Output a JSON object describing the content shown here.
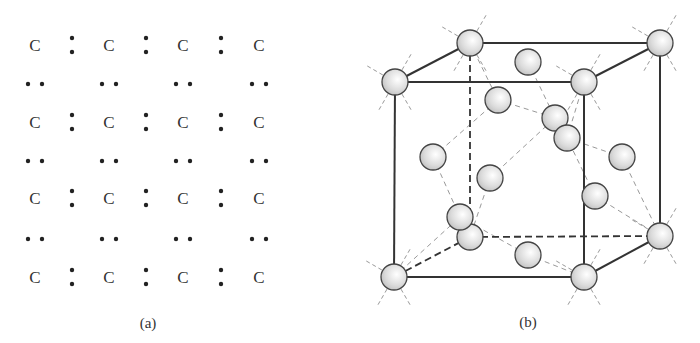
{
  "figure": {
    "panel_a": {
      "label": "(a)",
      "atom_symbol": "C",
      "description": "Lewis dot structure of carbon lattice: 4x4 grid of C atoms with shared electron pairs",
      "columns_x": [
        35,
        109,
        183,
        259
      ],
      "rows_y": [
        45,
        122,
        198,
        277
      ],
      "vertical_pair_x": [
        72,
        146,
        221
      ],
      "horizontal_pair_y": [
        84,
        161,
        239
      ]
    },
    "panel_b": {
      "label": "(b)",
      "description": "Diamond cubic crystal structure unit cell",
      "cube": {
        "front": {
          "tl": [
            395,
            82
          ],
          "tr": [
            584,
            82
          ],
          "bl": [
            394,
            277
          ],
          "br": [
            584,
            277
          ]
        },
        "back": {
          "tl": [
            470,
            43
          ],
          "tr": [
            660,
            43
          ],
          "bl": [
            470,
            237
          ],
          "br": [
            660,
            236
          ]
        }
      },
      "interior_atoms": [
        [
          528,
          62
        ],
        [
          498,
          100
        ],
        [
          555,
          118
        ],
        [
          567,
          138
        ],
        [
          433,
          157
        ],
        [
          622,
          157
        ],
        [
          490,
          178
        ],
        [
          595,
          196
        ],
        [
          460,
          217
        ],
        [
          528,
          255
        ]
      ],
      "colors": {
        "atom_fill": "#d8d8d8",
        "atom_stroke": "#444444",
        "bond": "#333333",
        "guide": "#999999"
      }
    }
  }
}
